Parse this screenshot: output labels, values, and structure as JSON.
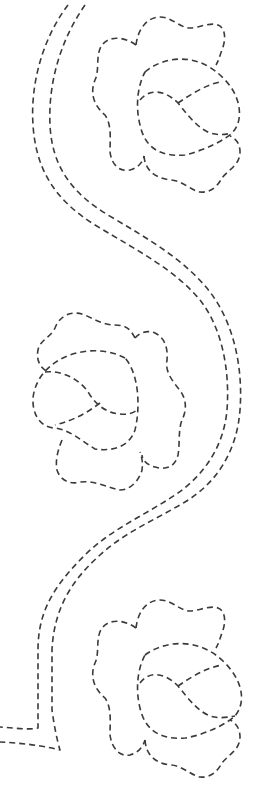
{
  "pattern": {
    "title": "Quilting stencil: vine border with three flowers",
    "stroke_color": "#3a3a3a",
    "background_color": "#ffffff",
    "line_style": "dashed",
    "elements": {
      "vine": "Double dashed S-curving vine running top to bottom, ending in a horizontal turn at lower left",
      "flowers": [
        {
          "position": "top-right",
          "orientation": "facing right"
        },
        {
          "position": "middle-left",
          "orientation": "facing left (mirrored)"
        },
        {
          "position": "bottom-right",
          "orientation": "facing right"
        }
      ]
    }
  }
}
